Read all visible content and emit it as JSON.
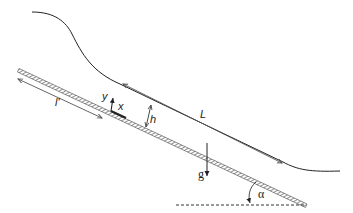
{
  "figure": {
    "type": "schematic",
    "labels": {
      "length_film": "L",
      "length_upstream": "l'",
      "height": "h",
      "axis_x": "x",
      "axis_y": "y",
      "gravity": "g",
      "angle": "α"
    },
    "colors": {
      "stroke": "#222222",
      "arrow": "#555555",
      "hatch": "#444444",
      "background": "#ffffff"
    }
  }
}
